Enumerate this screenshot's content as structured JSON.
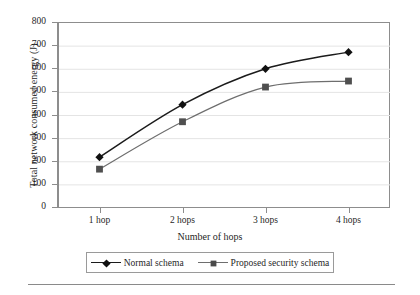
{
  "chart_data": {
    "type": "line",
    "title": "",
    "xlabel": "Number of hops",
    "ylabel": "Total network consumed energy (J)",
    "categories": [
      "1 hop",
      "2 hops",
      "3 hops",
      "4 hops"
    ],
    "ylim": [
      0,
      800
    ],
    "ytick_step": 100,
    "yticks": [
      800,
      700,
      600,
      500,
      400,
      300,
      200,
      100,
      0
    ],
    "grid": "horizontal",
    "legend_position": "bottom-center",
    "series": [
      {
        "name": "Normal schema",
        "marker": "diamond",
        "color": "#1b1b1b",
        "values": [
          220,
          447,
          602,
          674
        ]
      },
      {
        "name": "Proposed security schema",
        "marker": "square",
        "color": "#6e6e6e",
        "values": [
          168,
          373,
          523,
          549
        ]
      }
    ]
  },
  "axes": {
    "y_title": "Total network consumed energy (J)",
    "x_title": "Number of hops",
    "y_tick_labels": [
      "800",
      "700",
      "600",
      "500",
      "400",
      "300",
      "200",
      "100",
      "0"
    ],
    "x_tick_labels": [
      "1 hop",
      "2 hops",
      "3 hops",
      "4 hops"
    ]
  },
  "legend": {
    "entries": [
      {
        "label": "Normal schema",
        "marker": "diamond-marker-icon"
      },
      {
        "label": "Proposed security schema",
        "marker": "square-marker-icon"
      }
    ]
  },
  "colors": {
    "series_normal": "#1b1b1b",
    "series_proposed": "#6e6e6e",
    "axis": "#8d8d8d",
    "grid": "#e4e4e4",
    "text": "#1f1f1f",
    "background": "#ffffff"
  }
}
